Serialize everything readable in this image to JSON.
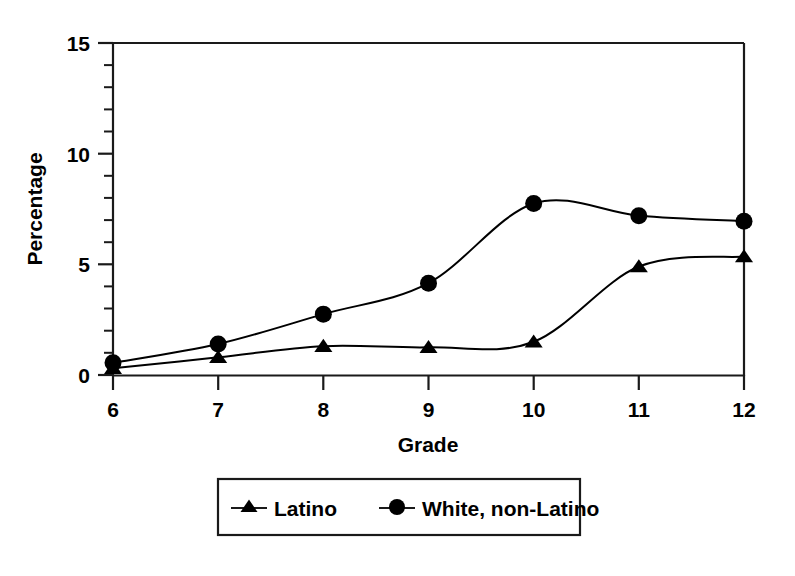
{
  "chart_data": {
    "type": "line",
    "title": "",
    "subtitle": "",
    "xlabel": "Grade",
    "ylabel": "Percentage",
    "x": [
      6,
      7,
      8,
      9,
      10,
      11,
      12
    ],
    "categories": [
      "6",
      "7",
      "8",
      "9",
      "10",
      "11",
      "12"
    ],
    "xtick_labels": [
      "6",
      "7",
      "8",
      "9",
      "10",
      "11",
      "12"
    ],
    "ytick_labels": [
      "0",
      "5",
      "10",
      "15"
    ],
    "ytick_values": [
      0,
      5,
      10,
      15
    ],
    "yminor_step": 1,
    "xlim": [
      6,
      12
    ],
    "ylim": [
      0,
      15
    ],
    "grid": false,
    "legend_position": "below-center",
    "series": [
      {
        "name": "Latino",
        "marker": "triangle",
        "color": "#000000",
        "values": [
          0.3,
          0.8,
          1.3,
          1.25,
          1.5,
          4.9,
          5.35
        ]
      },
      {
        "name": "White, non-Latino",
        "marker": "circle",
        "color": "#000000",
        "values": [
          0.55,
          1.4,
          2.75,
          4.15,
          7.75,
          7.2,
          6.95
        ]
      }
    ]
  },
  "axes": {
    "y_label": "Percentage",
    "x_label": "Grade",
    "y_ticks": [
      "15",
      "10",
      "5",
      "0"
    ],
    "x_ticks": [
      "6",
      "7",
      "8",
      "9",
      "10",
      "11",
      "12"
    ]
  },
  "legend": {
    "entries": [
      {
        "label": "Latino",
        "marker": "triangle-marker"
      },
      {
        "label": "White, non-Latino",
        "marker": "circle-marker"
      }
    ]
  },
  "style": {
    "line_color": "#1a1a1a",
    "marker_color": "#000000",
    "frame_color": "#1a1a1a",
    "background": "#ffffff"
  }
}
